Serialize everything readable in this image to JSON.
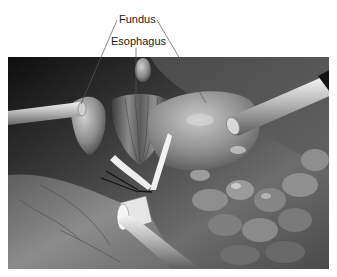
{
  "figure": {
    "labels": {
      "fundus": "Fundus",
      "esophagus": "Esophagus"
    },
    "colors": {
      "background": "#ffffff",
      "scene_dark": "#1b1b1b",
      "tissue_mid": "#8a8a8a",
      "tissue_light": "#d8d8d8",
      "label_text": "#1a1a1a",
      "leader_line": "#555555"
    }
  }
}
